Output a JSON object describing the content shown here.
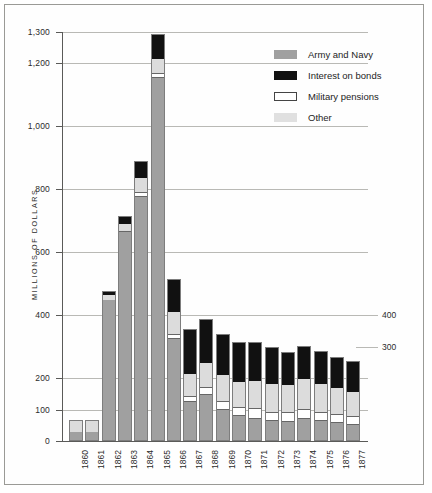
{
  "chart_data": {
    "type": "bar",
    "subtype": "stacked",
    "title": "",
    "xlabel": "",
    "ylabel": "MILLIONS OF DOLLARS",
    "ylim": [
      0,
      1300
    ],
    "yticks": [
      "0",
      "100",
      "200",
      "400",
      "600",
      "800",
      "1,000",
      "1,200",
      "1,300"
    ],
    "ytick_values": [
      0,
      100,
      200,
      400,
      600,
      800,
      1000,
      1200,
      1300
    ],
    "right_labels": [
      "400",
      "300"
    ],
    "right_label_values": [
      400,
      300
    ],
    "grid": "horizontal",
    "legend_position": "top-right",
    "categories": [
      "1860",
      "1861",
      "1862",
      "1863",
      "1864",
      "1865",
      "1866",
      "1867",
      "1868",
      "1869",
      "1870",
      "1871",
      "1872",
      "1873",
      "1874",
      "1875",
      "1876",
      "1877"
    ],
    "series": [
      {
        "name": "Army and Navy",
        "color": "#a0a0a0",
        "values": [
          28,
          29,
          448,
          663,
          776,
          1153,
          325,
          123,
          147,
          99,
          79,
          70,
          64,
          61,
          71,
          63,
          57,
          51
        ]
      },
      {
        "name": "Military pensions",
        "color": "#ffffff",
        "values": [
          1,
          1,
          1,
          5,
          16,
          16,
          16,
          21,
          24,
          29,
          29,
          34,
          29,
          30,
          30,
          29,
          28,
          28
        ]
      },
      {
        "name": "Other",
        "color": "#dcdcdc",
        "values": [
          35,
          33,
          14,
          21,
          43,
          45,
          68,
          70,
          76,
          81,
          78,
          85,
          87,
          88,
          95,
          90,
          83,
          77
        ]
      },
      {
        "name": "Interest on bonds",
        "color": "#111111",
        "values": [
          3,
          4,
          13,
          25,
          54,
          78,
          105,
          143,
          141,
          131,
          129,
          125,
          117,
          104,
          107,
          103,
          100,
          97
        ]
      }
    ],
    "totals": [
      67,
      67,
      476,
      714,
      889,
      1292,
      514,
      357,
      388,
      340,
      315,
      314,
      297,
      283,
      303,
      285,
      268,
      253
    ]
  },
  "legend": {
    "items": [
      {
        "label": "Army and Navy",
        "swatch": "army-swatch"
      },
      {
        "label": "Interest on bonds",
        "swatch": "interest-swatch"
      },
      {
        "label": "Military pensions",
        "swatch": "pension-swatch"
      },
      {
        "label": "Other",
        "swatch": "other-swatch"
      }
    ]
  }
}
